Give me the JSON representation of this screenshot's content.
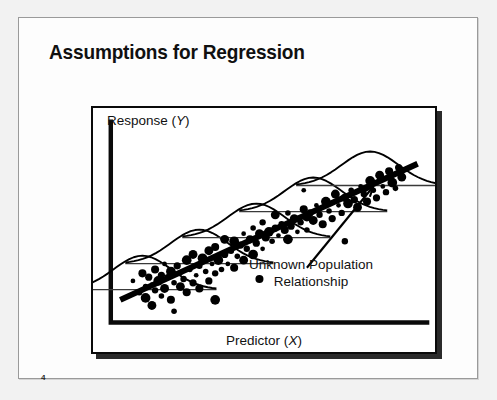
{
  "slide": {
    "title": "Assumptions for Regression",
    "page_number": "4",
    "background_color": "#f2f2f2",
    "paper_color": "#fdfdfd",
    "ink_color": "#0a0a0a"
  },
  "figure": {
    "y_axis_label_text": "Response (",
    "y_axis_label_var": "Y",
    "y_axis_label_close": ")",
    "x_axis_label_text": "Predictor (",
    "x_axis_label_var": "X",
    "x_axis_label_close": ")",
    "annotation_line1": "Unknown Population",
    "annotation_line2": "Relationship"
  },
  "chart_data": {
    "type": "scatter",
    "title": "Assumptions for Regression",
    "xlabel": "Predictor (X)",
    "ylabel": "Response (Y)",
    "xlim": [
      0,
      100
    ],
    "ylim": [
      0,
      100
    ],
    "grid": false,
    "legend": null,
    "annotations": [
      {
        "text": "Unknown Population Relationship",
        "x": 60,
        "y": 22,
        "arrow_to": [
          83,
          72
        ]
      }
    ],
    "regression_line": {
      "name": "Unknown Population Relationship",
      "x": [
        3,
        97
      ],
      "y": [
        12,
        84
      ],
      "slope": 0.766,
      "intercept": 9.7
    },
    "normal_curves": {
      "description": "Bell-shaped normal error distributions drawn at equally spaced x positions, centered on the regression line",
      "x_positions": [
        10,
        28,
        46,
        64,
        82
      ],
      "sigma": 9
    },
    "series": [
      {
        "name": "observations",
        "marker": "filled-circle",
        "color": "#000000",
        "x": [
          7,
          9,
          10,
          11,
          11,
          12,
          13,
          13,
          14,
          14,
          15,
          16,
          16,
          17,
          17,
          18,
          19,
          19,
          20,
          21,
          22,
          22,
          23,
          24,
          24,
          25,
          26,
          26,
          27,
          28,
          28,
          29,
          30,
          31,
          31,
          32,
          33,
          33,
          34,
          35,
          36,
          36,
          37,
          38,
          39,
          39,
          40,
          41,
          42,
          42,
          43,
          44,
          45,
          45,
          46,
          47,
          48,
          48,
          49,
          50,
          51,
          52,
          52,
          53,
          54,
          55,
          56,
          56,
          57,
          58,
          59,
          60,
          61,
          62,
          62,
          63,
          64,
          65,
          66,
          67,
          68,
          69,
          70,
          71,
          72,
          73,
          74,
          75,
          76,
          77,
          78,
          79,
          80,
          81,
          82,
          83,
          84,
          85,
          86,
          87,
          88,
          89,
          90,
          91,
          92,
          61,
          74,
          47,
          33,
          20
        ],
        "y": [
          22,
          16,
          26,
          13,
          19,
          24,
          9,
          20,
          17,
          28,
          22,
          14,
          25,
          18,
          31,
          24,
          12,
          27,
          21,
          30,
          19,
          26,
          23,
          16,
          33,
          28,
          21,
          36,
          25,
          30,
          18,
          34,
          27,
          22,
          38,
          31,
          26,
          40,
          33,
          28,
          36,
          44,
          31,
          38,
          29,
          43,
          35,
          41,
          33,
          47,
          39,
          44,
          36,
          50,
          42,
          47,
          39,
          53,
          45,
          48,
          43,
          50,
          57,
          46,
          52,
          49,
          44,
          58,
          51,
          55,
          48,
          53,
          60,
          56,
          49,
          58,
          54,
          62,
          57,
          52,
          64,
          59,
          55,
          68,
          62,
          58,
          66,
          63,
          70,
          65,
          61,
          72,
          68,
          64,
          75,
          70,
          66,
          78,
          72,
          69,
          80,
          74,
          71,
          82,
          77,
          70,
          43,
          23,
          12,
          6
        ]
      }
    ]
  }
}
